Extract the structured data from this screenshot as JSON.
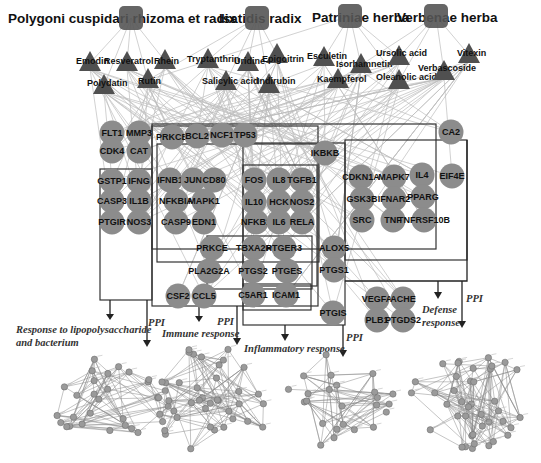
{
  "colors": {
    "herb_node": "#555555",
    "compound_node": "#505050",
    "gene_node": "#8c8c8c",
    "edge": "#bdbdbd",
    "box_stroke": "#333333",
    "label_text": "#111111"
  },
  "herbs": [
    {
      "id": "polygoni",
      "label": "Polygoni cuspidari rhizoma et radix",
      "x": 131,
      "y": 18,
      "lx": 8,
      "ly": 23
    },
    {
      "id": "isatidis",
      "label": "Isatidis radix",
      "x": 257,
      "y": 18,
      "lx": 219,
      "ly": 23
    },
    {
      "id": "patriniae",
      "label": "Patriniae herba",
      "x": 350,
      "y": 16,
      "lx": 312,
      "ly": 22
    },
    {
      "id": "verbenae",
      "label": "Verbenae herba",
      "x": 436,
      "y": 16,
      "lx": 397,
      "ly": 22
    }
  ],
  "compounds": [
    {
      "label": "Emodin",
      "x": 90,
      "y": 63,
      "lx": 76,
      "ly": 64
    },
    {
      "label": "Resveratrol",
      "x": 127,
      "y": 63,
      "lx": 104,
      "ly": 64
    },
    {
      "label": "Rhein",
      "x": 165,
      "y": 61,
      "lx": 154,
      "ly": 64
    },
    {
      "label": "Polydatin",
      "x": 104,
      "y": 86,
      "lx": 87,
      "ly": 86
    },
    {
      "label": "Rutin",
      "x": 148,
      "y": 80,
      "lx": 138,
      "ly": 84
    },
    {
      "label": "Tryptanthrin",
      "x": 208,
      "y": 60,
      "lx": 187,
      "ly": 62
    },
    {
      "label": "Uridine",
      "x": 248,
      "y": 63,
      "lx": 234,
      "ly": 64
    },
    {
      "label": "Epigoitrin",
      "x": 277,
      "y": 55,
      "lx": 262,
      "ly": 62
    },
    {
      "label": "Salicylic acid",
      "x": 226,
      "y": 82,
      "lx": 202,
      "ly": 84
    },
    {
      "label": "Indirubin",
      "x": 269,
      "y": 85,
      "lx": 257,
      "ly": 84
    },
    {
      "label": "Esculetin",
      "x": 324,
      "y": 58,
      "lx": 307,
      "ly": 59
    },
    {
      "label": "Isorhamnetin",
      "x": 361,
      "y": 65,
      "lx": 336,
      "ly": 67
    },
    {
      "label": "Kaempferol",
      "x": 338,
      "y": 80,
      "lx": 317,
      "ly": 82
    },
    {
      "label": "Ursolic acid",
      "x": 399,
      "y": 57,
      "lx": 376,
      "ly": 56
    },
    {
      "label": "Oleanolic acid",
      "x": 399,
      "y": 81,
      "lx": 376,
      "ly": 80
    },
    {
      "label": "Verbascoside",
      "x": 444,
      "y": 72,
      "lx": 418,
      "ly": 71
    },
    {
      "label": "Vitexin",
      "x": 469,
      "y": 55,
      "lx": 457,
      "ly": 56
    }
  ],
  "genes": [
    {
      "label": "FLT1",
      "x": 112,
      "y": 133
    },
    {
      "label": "MMP3",
      "x": 139,
      "y": 133
    },
    {
      "label": "CDK4",
      "x": 112,
      "y": 151
    },
    {
      "label": "CAT",
      "x": 139,
      "y": 151
    },
    {
      "label": "PRKCB",
      "x": 172,
      "y": 137
    },
    {
      "label": "BCL2",
      "x": 197,
      "y": 136
    },
    {
      "label": "NCF1",
      "x": 222,
      "y": 135
    },
    {
      "label": "TP53",
      "x": 245,
      "y": 135
    },
    {
      "label": "CA2",
      "x": 451,
      "y": 132
    },
    {
      "label": "IKBKB",
      "x": 325,
      "y": 153
    },
    {
      "label": "GSTP1",
      "x": 112,
      "y": 181
    },
    {
      "label": "IFNG",
      "x": 139,
      "y": 181
    },
    {
      "label": "CASP3",
      "x": 112,
      "y": 201
    },
    {
      "label": "IL1B",
      "x": 139,
      "y": 201
    },
    {
      "label": "PTGIR",
      "x": 112,
      "y": 222
    },
    {
      "label": "NOS3",
      "x": 139,
      "y": 222
    },
    {
      "label": "IFNB1",
      "x": 170,
      "y": 180
    },
    {
      "label": "JUN",
      "x": 193,
      "y": 180
    },
    {
      "label": "CD80",
      "x": 214,
      "y": 180
    },
    {
      "label": "NFKBIA",
      "x": 176,
      "y": 201
    },
    {
      "label": "MAPK1",
      "x": 204,
      "y": 201
    },
    {
      "label": "CASP9",
      "x": 176,
      "y": 222
    },
    {
      "label": "EDN1",
      "x": 204,
      "y": 222
    },
    {
      "label": "FOS",
      "x": 254,
      "y": 180
    },
    {
      "label": "IL8",
      "x": 279,
      "y": 180
    },
    {
      "label": "TGFB1",
      "x": 302,
      "y": 180
    },
    {
      "label": "IL10",
      "x": 254,
      "y": 202
    },
    {
      "label": "HCK",
      "x": 279,
      "y": 202
    },
    {
      "label": "NOS2",
      "x": 302,
      "y": 202
    },
    {
      "label": "NFKB1",
      "x": 256,
      "y": 222
    },
    {
      "label": "IL6",
      "x": 279,
      "y": 222
    },
    {
      "label": "RELA",
      "x": 302,
      "y": 222
    },
    {
      "label": "CDKN1A",
      "x": 361,
      "y": 177
    },
    {
      "label": "MAPK7",
      "x": 394,
      "y": 177
    },
    {
      "label": "IL4",
      "x": 422,
      "y": 175
    },
    {
      "label": "EIF4E",
      "x": 452,
      "y": 176
    },
    {
      "label": "GSK3B",
      "x": 362,
      "y": 199
    },
    {
      "label": "IFNAR2",
      "x": 394,
      "y": 199
    },
    {
      "label": "PPARG",
      "x": 423,
      "y": 197
    },
    {
      "label": "SRC",
      "x": 362,
      "y": 220
    },
    {
      "label": "TNF",
      "x": 393,
      "y": 220
    },
    {
      "label": "TNFRSF10B",
      "x": 424,
      "y": 220
    },
    {
      "label": "PRKCE",
      "x": 212,
      "y": 248
    },
    {
      "label": "TBXA2R",
      "x": 254,
      "y": 248
    },
    {
      "label": "PTGER3",
      "x": 284,
      "y": 248
    },
    {
      "label": "ALOX5",
      "x": 334,
      "y": 248
    },
    {
      "label": "PLA2G2A",
      "x": 209,
      "y": 271
    },
    {
      "label": "PTGS2",
      "x": 253,
      "y": 271
    },
    {
      "label": "PTGES",
      "x": 287,
      "y": 271
    },
    {
      "label": "PTGS1",
      "x": 334,
      "y": 270
    },
    {
      "label": "CSF2",
      "x": 178,
      "y": 296
    },
    {
      "label": "CCL5",
      "x": 204,
      "y": 296
    },
    {
      "label": "C5AR1",
      "x": 253,
      "y": 295
    },
    {
      "label": "ICAM1",
      "x": 286,
      "y": 295
    },
    {
      "label": "PTGIS",
      "x": 333,
      "y": 313
    },
    {
      "label": "VEGFA",
      "x": 377,
      "y": 299
    },
    {
      "label": "ACHE",
      "x": 403,
      "y": 299
    },
    {
      "label": "PLB1",
      "x": 377,
      "y": 320
    },
    {
      "label": "PTGDS2",
      "x": 403,
      "y": 320
    }
  ],
  "categories": [
    {
      "id": "lps",
      "label_lines": [
        "Response to lipopolysaccharide",
        "and bacterium"
      ],
      "lx": 16,
      "ly": 333
    },
    {
      "id": "immune",
      "label_lines": [
        "Immune response"
      ],
      "lx": 162,
      "ly": 337
    },
    {
      "id": "inflammatory",
      "label_lines": [
        "Inflammatory response"
      ],
      "lx": 244,
      "ly": 352
    },
    {
      "id": "defense",
      "label_lines": [
        "Defense",
        "response"
      ],
      "lx": 422,
      "ly": 313
    }
  ],
  "ppi_labels": [
    {
      "label": "PPI",
      "x": 148,
      "y": 326
    },
    {
      "label": "PPI",
      "x": 217,
      "y": 325
    },
    {
      "label": "PPI",
      "x": 346,
      "y": 341
    },
    {
      "label": "PPI",
      "x": 466,
      "y": 302
    }
  ],
  "ppi_networks": [
    {
      "id": "ppi-lps",
      "cx": 110,
      "cy": 400,
      "rx": 60,
      "ry": 48,
      "nodes": 30
    },
    {
      "id": "ppi-immune",
      "cx": 210,
      "cy": 400,
      "rx": 62,
      "ry": 55,
      "nodes": 38
    },
    {
      "id": "ppi-inflammatory",
      "cx": 336,
      "cy": 400,
      "rx": 60,
      "ry": 48,
      "nodes": 24
    },
    {
      "id": "ppi-defense",
      "cx": 470,
      "cy": 400,
      "rx": 60,
      "ry": 50,
      "nodes": 40
    }
  ]
}
